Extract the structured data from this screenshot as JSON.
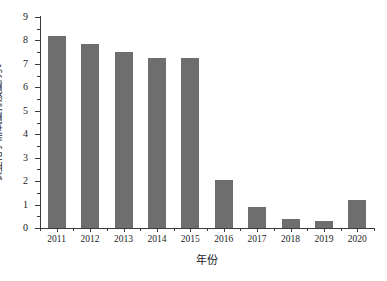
{
  "chart_data": {
    "type": "bar",
    "title": "",
    "subtitle": "",
    "xlabel": "年份",
    "ylabel": "农业化学需氧量排放量/万t",
    "categories": [
      "2011",
      "2012",
      "2013",
      "2014",
      "2015",
      "2016",
      "2017",
      "2018",
      "2019",
      "2020"
    ],
    "values": [
      8.2,
      7.85,
      7.5,
      7.25,
      7.25,
      2.05,
      0.9,
      0.4,
      0.3,
      1.2
    ],
    "series": [
      {
        "name": "农业化学需氧量排放量",
        "values": [
          8.2,
          7.85,
          7.5,
          7.25,
          7.25,
          2.05,
          0.9,
          0.4,
          0.3,
          1.2
        ]
      }
    ],
    "ylim": [
      0,
      9
    ],
    "ytick_labels": [
      "0",
      "1",
      "2",
      "3",
      "4",
      "5",
      "6",
      "7",
      "8",
      "9"
    ],
    "ytick_values": [
      0,
      1,
      2,
      3,
      4,
      5,
      6,
      7,
      8,
      9
    ],
    "yminor_values": [
      0.5,
      1.5,
      2.5,
      3.5,
      4.5,
      5.5,
      6.5,
      7.5,
      8.5
    ],
    "xtick_labels": [
      "2011",
      "2012",
      "2013",
      "2014",
      "2015",
      "2016",
      "2017",
      "2018",
      "2019",
      "2020"
    ],
    "grid": false,
    "legend": null,
    "legend_position": "none",
    "annotations": [],
    "colors": {
      "bar": "#6e6e6e",
      "axis": "#3a3a3a",
      "text": "#1a1a1a",
      "background": "#ffffff"
    }
  }
}
